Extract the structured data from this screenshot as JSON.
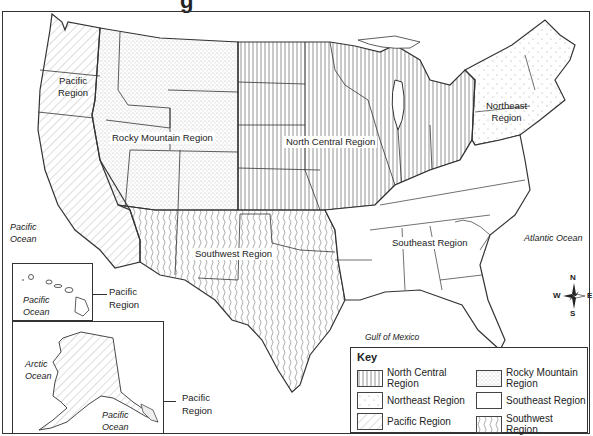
{
  "title_fragment": "g",
  "regions": {
    "pacific": "Pacific\nRegion",
    "rocky": "Rocky Mountain Region",
    "north_central": "North Central Region",
    "northeast": "Northeast\nRegion",
    "southwest": "Southwest Region",
    "southeast": "Southeast Region"
  },
  "oceans": {
    "pacific_main": "Pacific\nOcean",
    "atlantic": "Atlantic Ocean",
    "gulf": "Gulf of Mexico",
    "hawaii_pacific": "Pacific\nOcean",
    "arctic": "Arctic\nOcean",
    "alaska_pacific": "Pacific\nOcean"
  },
  "insets": {
    "hawaii_label": "Pacific\nRegion",
    "alaska_label": "Pacific\nRegion"
  },
  "compass": {
    "n": "N",
    "s": "S",
    "e": "E",
    "w": "W"
  },
  "key": {
    "title": "Key",
    "items": [
      {
        "label": "North Central\nRegion",
        "pattern": "vertical-lines"
      },
      {
        "label": "Rocky Mountain\nRegion",
        "pattern": "dots-dense"
      },
      {
        "label": "Northeast Region",
        "pattern": "dots-sparse"
      },
      {
        "label": "Southeast Region",
        "pattern": "blank"
      },
      {
        "label": "Pacific Region",
        "pattern": "diagonal-lines"
      },
      {
        "label": "Southwest Region",
        "pattern": "wavy-lines"
      }
    ]
  }
}
